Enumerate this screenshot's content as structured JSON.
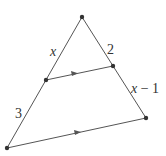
{
  "diagram": {
    "type": "triangle-with-parallel-line",
    "stroke_color": "#555555",
    "point_color": "#333333",
    "points": {
      "apex": [
        82,
        17
      ],
      "left_mid": [
        46,
        80
      ],
      "right_mid": [
        113,
        66
      ],
      "bottom_left": [
        7,
        148
      ],
      "bottom_right": [
        146,
        118
      ]
    },
    "labels": {
      "upper_left": "x",
      "upper_right": "2",
      "lower_left": "3",
      "lower_right_var": "x",
      "lower_right_rest": " − 1"
    },
    "parallel_marks": [
      "arrow",
      "arrow"
    ]
  }
}
